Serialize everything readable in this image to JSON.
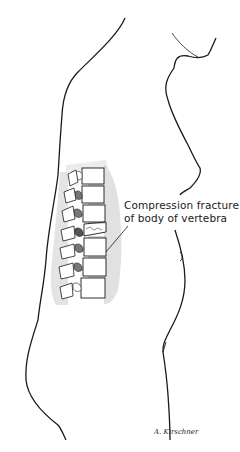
{
  "figure": {
    "annotation": {
      "line1": "Compression fracture",
      "line2": "of body of vertebra"
    },
    "signature": "A. Kirschner",
    "colors": {
      "line": "#1a1a1a",
      "background": "#ffffff",
      "hatch": "#555555"
    }
  }
}
